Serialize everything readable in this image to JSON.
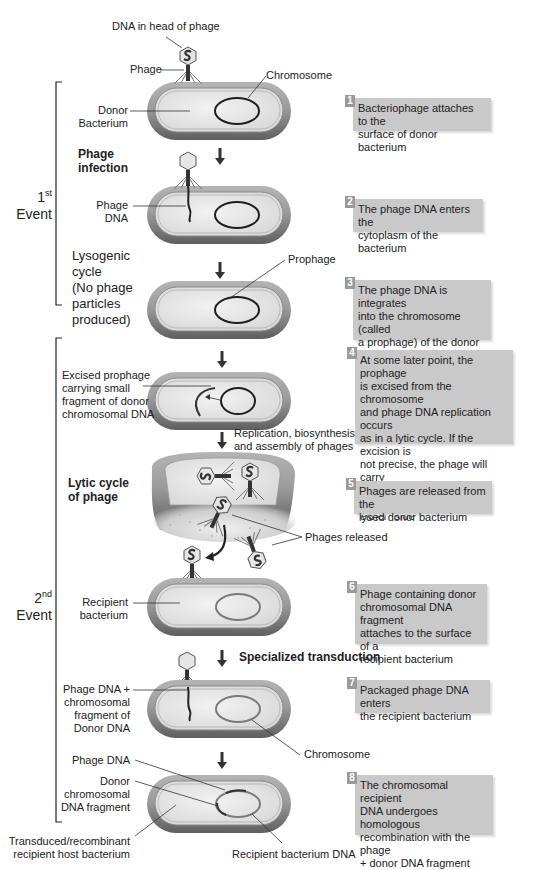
{
  "labels": {
    "dna_in_head": "DNA in head of phage",
    "phage": "Phage",
    "chromosome_top": "Chromosome",
    "donor_bacterium": "Donor\nBacterium",
    "phage_infection": "Phage\ninfection",
    "phage_dna": "Phage\nDNA",
    "lysogenic_cycle": "Lysogenic\ncycle\n(No phage\nparticles\nproduced)",
    "prophage": "Prophage",
    "excised_prophage": "Excised prophage\ncarrying small\nfragment of donor\nchromosomal DNA",
    "replication": "Replication, biosynthesis,\nand assembly of phages",
    "lytic_cycle": "Lytic cycle\nof phage",
    "phages_released": "Phages released",
    "recipient_bacterium": "Recipient\nbacterium",
    "specialized_transduction": "Specialized transduction",
    "phage_dna_chrom_fragment": "Phage DNA +\nchromosomal\nfragment of\nDonor DNA",
    "chromosome_bottom": "Chromosome",
    "phage_dna_bottom": "Phage DNA",
    "donor_chrom_fragment": "Donor\nchromosomal\nDNA fragment",
    "transduced_host": "Transduced/recombinant\nrecipient host bacterium",
    "recipient_bacterium_dna": "Recipient bacterium DNA"
  },
  "events": [
    {
      "num": "1",
      "sup": "st",
      "label": "Event"
    },
    {
      "num": "2",
      "sup": "nd",
      "label": "Event"
    }
  ],
  "steps": [
    {
      "num": "1",
      "text": "Bacteriophage attaches to the\nsurface of donor bacterium"
    },
    {
      "num": "2",
      "text": "The phage DNA enters the\ncytoplasm of the bacterium"
    },
    {
      "num": "3",
      "text": "The phage DNA is integrates\ninto the chromosome (called\na prophage) of the donor\nbacterium"
    },
    {
      "num": "4",
      "text": "At some later point, the prophage\nis excised from the chromosome\nand phage DNA replication occurs\nas in a lytic cycle. If the excision is\nnot precise, the phage will carry\nalong some bacterial DNA from\neither \"side\""
    },
    {
      "num": "5",
      "text": "Phages are released from the\nlysed donor bacterium"
    },
    {
      "num": "6",
      "text": "Phage containing donor\nchromosomal DNA fragment\nattaches to the surface of a\nrecipient bacterium"
    },
    {
      "num": "7",
      "text": "Packaged phage DNA enters\nthe recipient bacterium"
    },
    {
      "num": "8",
      "text": "The chromosomal recipient\nDNA undergoes homologous\nrecombination with the phage\n+ donor DNA fragment"
    }
  ],
  "colors": {
    "step_box": "#c9c9c9",
    "step_number": "#9a9a9a",
    "bacterium_outer": "#8a8a8a",
    "bacterium_inner": "#e4e4e4",
    "donor_chromosome": "#1e1e1e",
    "recipient_chromosome": "#7a7a7a"
  }
}
